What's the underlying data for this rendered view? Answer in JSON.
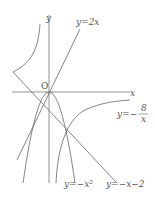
{
  "diagram": {
    "axes": {
      "x_label": "x",
      "y_label": "y",
      "origin_label": "O"
    },
    "curves": [
      {
        "id": "line-2x",
        "label": "y=2x"
      },
      {
        "id": "parabola",
        "label": "y=−x²"
      },
      {
        "id": "line-neg-x-2",
        "label": "y=−x−2"
      },
      {
        "id": "hyperbola",
        "label_prefix": "y=−",
        "label_num": "8",
        "label_den": "x"
      }
    ]
  }
}
